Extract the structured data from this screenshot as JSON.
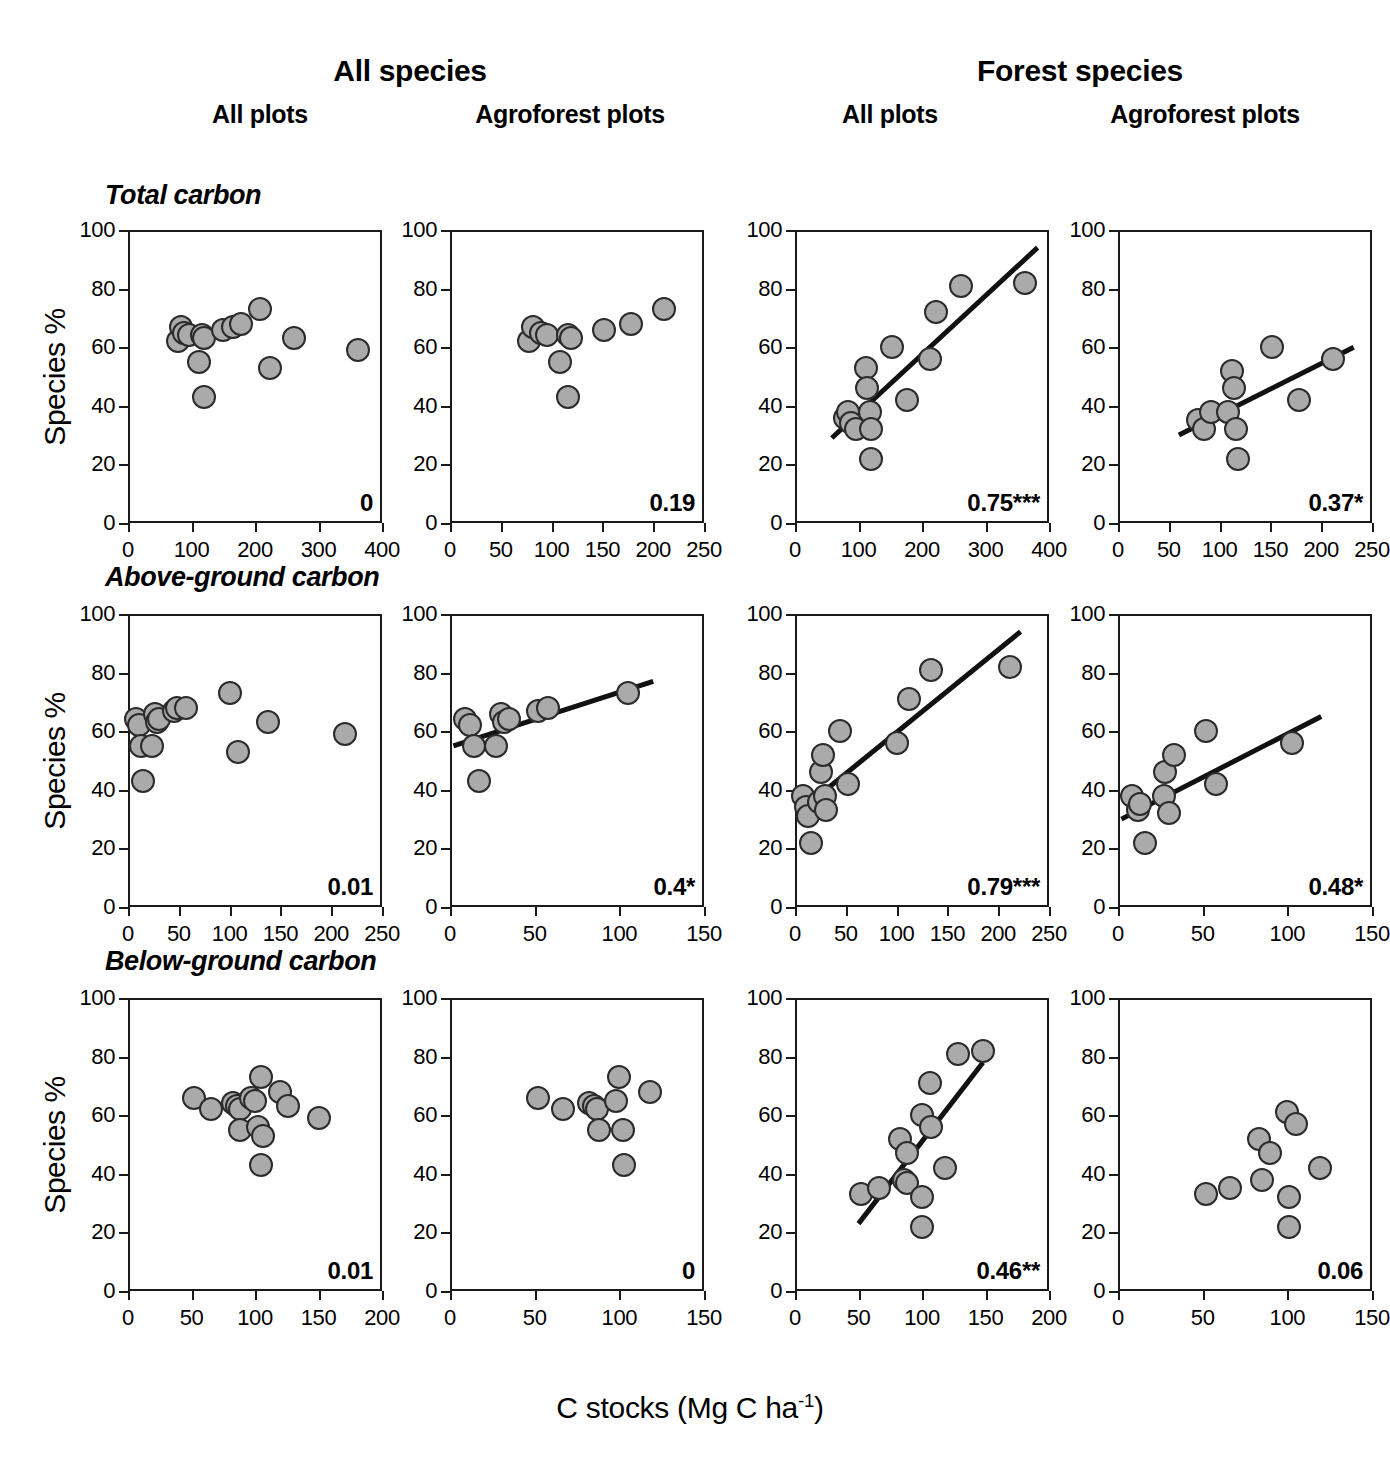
{
  "figure": {
    "group_headers": [
      {
        "label": "All species"
      },
      {
        "label": "Forest species"
      }
    ],
    "column_headers": [
      {
        "label": "All plots"
      },
      {
        "label": "Agroforest plots"
      },
      {
        "label": "All plots"
      },
      {
        "label": "Agroforest plots"
      }
    ],
    "row_headers": [
      {
        "label": "Total carbon"
      },
      {
        "label": "Above-ground carbon"
      },
      {
        "label": "Below-ground carbon"
      }
    ],
    "y_axis_label": "Species %",
    "x_axis_label_prefix": "C stocks (Mg C ha",
    "x_axis_label_sup": "-1",
    "x_axis_label_suffix": ")",
    "marker_fill": "#aaaaaa",
    "marker_stroke": "#2b2b2b",
    "line_color": "#111111",
    "axis_color": "#1a1a1a"
  },
  "chart_data": [
    {
      "id": "p1",
      "type": "scatter",
      "title": "Total carbon / All species / All plots",
      "xlabel": "C stocks (Mg C ha-1)",
      "ylabel": "Species %",
      "xlim": [
        0,
        400
      ],
      "ylim": [
        0,
        100
      ],
      "xticks": [
        0,
        100,
        200,
        300,
        400
      ],
      "yticks": [
        0,
        20,
        40,
        60,
        80,
        100
      ],
      "grid": false,
      "annotation": "0",
      "r_squared": 0,
      "significance": "",
      "fit_line": null,
      "points": [
        {
          "x": 78,
          "y": 62
        },
        {
          "x": 83,
          "y": 67
        },
        {
          "x": 88,
          "y": 65
        },
        {
          "x": 96,
          "y": 64
        },
        {
          "x": 112,
          "y": 55
        },
        {
          "x": 116,
          "y": 64
        },
        {
          "x": 120,
          "y": 63
        },
        {
          "x": 120,
          "y": 43
        },
        {
          "x": 150,
          "y": 66
        },
        {
          "x": 165,
          "y": 67
        },
        {
          "x": 178,
          "y": 68
        },
        {
          "x": 208,
          "y": 73
        },
        {
          "x": 224,
          "y": 53
        },
        {
          "x": 262,
          "y": 63
        },
        {
          "x": 362,
          "y": 59
        }
      ]
    },
    {
      "id": "p2",
      "type": "scatter",
      "title": "Total carbon / All species / Agroforest plots",
      "xlabel": "C stocks (Mg C ha-1)",
      "ylabel": "Species %",
      "xlim": [
        0,
        250
      ],
      "ylim": [
        0,
        100
      ],
      "xticks": [
        0,
        50,
        100,
        150,
        200,
        250
      ],
      "yticks": [
        0,
        20,
        40,
        60,
        80,
        100
      ],
      "grid": false,
      "annotation": "0.19",
      "r_squared": 0.19,
      "significance": "",
      "fit_line": null,
      "points": [
        {
          "x": 78,
          "y": 62
        },
        {
          "x": 82,
          "y": 67
        },
        {
          "x": 90,
          "y": 65
        },
        {
          "x": 95,
          "y": 64
        },
        {
          "x": 108,
          "y": 55
        },
        {
          "x": 116,
          "y": 64
        },
        {
          "x": 119,
          "y": 63
        },
        {
          "x": 116,
          "y": 43
        },
        {
          "x": 152,
          "y": 66
        },
        {
          "x": 178,
          "y": 68
        },
        {
          "x": 211,
          "y": 73
        }
      ]
    },
    {
      "id": "p3",
      "type": "scatter",
      "title": "Total carbon / Forest species / All plots",
      "xlabel": "C stocks (Mg C ha-1)",
      "ylabel": "Species %",
      "xlim": [
        0,
        400
      ],
      "ylim": [
        0,
        100
      ],
      "xticks": [
        0,
        100,
        200,
        300,
        400
      ],
      "yticks": [
        0,
        20,
        40,
        60,
        80,
        100
      ],
      "grid": false,
      "annotation": "0.75***",
      "r_squared": 0.75,
      "significance": "***",
      "fit_line": {
        "x1": 58,
        "y1": 29,
        "x2": 382,
        "y2": 94
      },
      "points": [
        {
          "x": 78,
          "y": 36
        },
        {
          "x": 84,
          "y": 38
        },
        {
          "x": 88,
          "y": 34
        },
        {
          "x": 96,
          "y": 32
        },
        {
          "x": 112,
          "y": 53
        },
        {
          "x": 114,
          "y": 46
        },
        {
          "x": 118,
          "y": 38
        },
        {
          "x": 120,
          "y": 32
        },
        {
          "x": 120,
          "y": 22
        },
        {
          "x": 152,
          "y": 60
        },
        {
          "x": 176,
          "y": 42
        },
        {
          "x": 212,
          "y": 56
        },
        {
          "x": 222,
          "y": 72
        },
        {
          "x": 262,
          "y": 81
        },
        {
          "x": 362,
          "y": 82
        }
      ]
    },
    {
      "id": "p4",
      "type": "scatter",
      "title": "Total carbon / Forest species / Agroforest plots",
      "xlabel": "C stocks (Mg C ha-1)",
      "ylabel": "Species %",
      "xlim": [
        0,
        250
      ],
      "ylim": [
        0,
        100
      ],
      "xticks": [
        0,
        50,
        100,
        150,
        200,
        250
      ],
      "yticks": [
        0,
        20,
        40,
        60,
        80,
        100
      ],
      "grid": false,
      "annotation": "0.37*",
      "r_squared": 0.37,
      "significance": "*",
      "fit_line": {
        "x1": 60,
        "y1": 30,
        "x2": 232,
        "y2": 60
      },
      "points": [
        {
          "x": 79,
          "y": 35
        },
        {
          "x": 85,
          "y": 32
        },
        {
          "x": 92,
          "y": 38
        },
        {
          "x": 108,
          "y": 38
        },
        {
          "x": 112,
          "y": 52
        },
        {
          "x": 114,
          "y": 46
        },
        {
          "x": 116,
          "y": 32
        },
        {
          "x": 118,
          "y": 22
        },
        {
          "x": 152,
          "y": 60
        },
        {
          "x": 178,
          "y": 42
        },
        {
          "x": 212,
          "y": 56
        }
      ]
    },
    {
      "id": "p5",
      "type": "scatter",
      "title": "Above-ground carbon / All species / All plots",
      "xlabel": "C stocks (Mg C ha-1)",
      "ylabel": "Species %",
      "xlim": [
        0,
        250
      ],
      "ylim": [
        0,
        100
      ],
      "xticks": [
        0,
        50,
        100,
        150,
        200,
        250
      ],
      "yticks": [
        0,
        20,
        40,
        60,
        80,
        100
      ],
      "grid": false,
      "annotation": "0.01",
      "r_squared": 0.01,
      "significance": "",
      "fit_line": null,
      "points": [
        {
          "x": 8,
          "y": 64
        },
        {
          "x": 11,
          "y": 62
        },
        {
          "x": 13,
          "y": 55
        },
        {
          "x": 15,
          "y": 43
        },
        {
          "x": 24,
          "y": 55
        },
        {
          "x": 27,
          "y": 66
        },
        {
          "x": 29,
          "y": 63
        },
        {
          "x": 31,
          "y": 64
        },
        {
          "x": 45,
          "y": 67
        },
        {
          "x": 48,
          "y": 68
        },
        {
          "x": 57,
          "y": 68
        },
        {
          "x": 100,
          "y": 73
        },
        {
          "x": 108,
          "y": 53
        },
        {
          "x": 138,
          "y": 63
        },
        {
          "x": 214,
          "y": 59
        }
      ]
    },
    {
      "id": "p6",
      "type": "scatter",
      "title": "Above-ground carbon / All species / Agroforest plots",
      "xlabel": "C stocks (Mg C ha-1)",
      "ylabel": "Species %",
      "xlim": [
        0,
        150
      ],
      "ylim": [
        0,
        100
      ],
      "xticks": [
        0,
        50,
        100,
        150
      ],
      "yticks": [
        0,
        20,
        40,
        60,
        80,
        100
      ],
      "grid": false,
      "annotation": "0.4*",
      "r_squared": 0.4,
      "significance": "*",
      "fit_line": {
        "x1": 2,
        "y1": 55,
        "x2": 120,
        "y2": 77
      },
      "points": [
        {
          "x": 9,
          "y": 64
        },
        {
          "x": 12,
          "y": 62
        },
        {
          "x": 14,
          "y": 55
        },
        {
          "x": 17,
          "y": 43
        },
        {
          "x": 27,
          "y": 55
        },
        {
          "x": 30,
          "y": 66
        },
        {
          "x": 32,
          "y": 63
        },
        {
          "x": 35,
          "y": 64
        },
        {
          "x": 52,
          "y": 67
        },
        {
          "x": 58,
          "y": 68
        },
        {
          "x": 105,
          "y": 73
        }
      ]
    },
    {
      "id": "p7",
      "type": "scatter",
      "title": "Above-ground carbon / Forest species / All plots",
      "xlabel": "C stocks (Mg C ha-1)",
      "ylabel": "Species %",
      "xlim": [
        0,
        250
      ],
      "ylim": [
        0,
        100
      ],
      "xticks": [
        0,
        50,
        100,
        150,
        200,
        250
      ],
      "yticks": [
        0,
        20,
        40,
        60,
        80,
        100
      ],
      "grid": false,
      "annotation": "0.79***",
      "r_squared": 0.79,
      "significance": "***",
      "fit_line": {
        "x1": 2,
        "y1": 32,
        "x2": 222,
        "y2": 94
      },
      "points": [
        {
          "x": 8,
          "y": 38
        },
        {
          "x": 11,
          "y": 34
        },
        {
          "x": 13,
          "y": 31
        },
        {
          "x": 16,
          "y": 22
        },
        {
          "x": 24,
          "y": 36
        },
        {
          "x": 26,
          "y": 46
        },
        {
          "x": 28,
          "y": 52
        },
        {
          "x": 30,
          "y": 38
        },
        {
          "x": 31,
          "y": 33
        },
        {
          "x": 44,
          "y": 60
        },
        {
          "x": 52,
          "y": 42
        },
        {
          "x": 100,
          "y": 56
        },
        {
          "x": 112,
          "y": 71
        },
        {
          "x": 134,
          "y": 81
        },
        {
          "x": 212,
          "y": 82
        }
      ]
    },
    {
      "id": "p8",
      "type": "scatter",
      "title": "Above-ground carbon / Forest species / Agroforest plots",
      "xlabel": "C stocks (Mg C ha-1)",
      "ylabel": "Species %",
      "xlim": [
        0,
        150
      ],
      "ylim": [
        0,
        100
      ],
      "xticks": [
        0,
        50,
        100,
        150
      ],
      "yticks": [
        0,
        20,
        40,
        60,
        80,
        100
      ],
      "grid": false,
      "annotation": "0.48*",
      "r_squared": 0.48,
      "significance": "*",
      "fit_line": {
        "x1": 2,
        "y1": 30,
        "x2": 120,
        "y2": 65
      },
      "points": [
        {
          "x": 8,
          "y": 38
        },
        {
          "x": 12,
          "y": 33
        },
        {
          "x": 13,
          "y": 35
        },
        {
          "x": 16,
          "y": 22
        },
        {
          "x": 27,
          "y": 38
        },
        {
          "x": 28,
          "y": 46
        },
        {
          "x": 30,
          "y": 32
        },
        {
          "x": 33,
          "y": 52
        },
        {
          "x": 52,
          "y": 60
        },
        {
          "x": 58,
          "y": 42
        },
        {
          "x": 103,
          "y": 56
        }
      ]
    },
    {
      "id": "p9",
      "type": "scatter",
      "title": "Below-ground carbon / All species / All plots",
      "xlabel": "C stocks (Mg C ha-1)",
      "ylabel": "Species %",
      "xlim": [
        0,
        200
      ],
      "ylim": [
        0,
        100
      ],
      "xticks": [
        0,
        50,
        100,
        150,
        200
      ],
      "yticks": [
        0,
        20,
        40,
        60,
        80,
        100
      ],
      "grid": false,
      "annotation": "0.01",
      "r_squared": 0.01,
      "significance": "",
      "fit_line": null,
      "points": [
        {
          "x": 52,
          "y": 66
        },
        {
          "x": 65,
          "y": 62
        },
        {
          "x": 83,
          "y": 64
        },
        {
          "x": 86,
          "y": 63
        },
        {
          "x": 88,
          "y": 62
        },
        {
          "x": 88,
          "y": 55
        },
        {
          "x": 97,
          "y": 66
        },
        {
          "x": 100,
          "y": 65
        },
        {
          "x": 102,
          "y": 56
        },
        {
          "x": 105,
          "y": 73
        },
        {
          "x": 106,
          "y": 53
        },
        {
          "x": 105,
          "y": 43
        },
        {
          "x": 120,
          "y": 68
        },
        {
          "x": 126,
          "y": 63
        },
        {
          "x": 150,
          "y": 59
        }
      ]
    },
    {
      "id": "p10",
      "type": "scatter",
      "title": "Below-ground carbon / All species / Agroforest plots",
      "xlabel": "C stocks (Mg C ha-1)",
      "ylabel": "Species %",
      "xlim": [
        0,
        150
      ],
      "ylim": [
        0,
        100
      ],
      "xticks": [
        0,
        50,
        100,
        150
      ],
      "yticks": [
        0,
        20,
        40,
        60,
        80,
        100
      ],
      "grid": false,
      "annotation": "0",
      "r_squared": 0,
      "significance": "",
      "fit_line": null,
      "points": [
        {
          "x": 52,
          "y": 66
        },
        {
          "x": 67,
          "y": 62
        },
        {
          "x": 82,
          "y": 64
        },
        {
          "x": 85,
          "y": 63
        },
        {
          "x": 87,
          "y": 62
        },
        {
          "x": 88,
          "y": 55
        },
        {
          "x": 98,
          "y": 65
        },
        {
          "x": 100,
          "y": 73
        },
        {
          "x": 102,
          "y": 55
        },
        {
          "x": 103,
          "y": 43
        },
        {
          "x": 118,
          "y": 68
        }
      ]
    },
    {
      "id": "p11",
      "type": "scatter",
      "title": "Below-ground carbon / Forest species / All plots",
      "xlabel": "C stocks (Mg C ha-1)",
      "ylabel": "Species %",
      "xlim": [
        0,
        200
      ],
      "ylim": [
        0,
        100
      ],
      "xticks": [
        0,
        50,
        100,
        150,
        200
      ],
      "yticks": [
        0,
        20,
        40,
        60,
        80,
        100
      ],
      "grid": false,
      "annotation": "0.46**",
      "r_squared": 0.46,
      "significance": "**",
      "fit_line": {
        "x1": 50,
        "y1": 23,
        "x2": 148,
        "y2": 78
      },
      "points": [
        {
          "x": 52,
          "y": 33
        },
        {
          "x": 66,
          "y": 35
        },
        {
          "x": 83,
          "y": 52
        },
        {
          "x": 86,
          "y": 38
        },
        {
          "x": 88,
          "y": 47
        },
        {
          "x": 88,
          "y": 37
        },
        {
          "x": 100,
          "y": 60
        },
        {
          "x": 100,
          "y": 32
        },
        {
          "x": 100,
          "y": 22
        },
        {
          "x": 106,
          "y": 71
        },
        {
          "x": 107,
          "y": 56
        },
        {
          "x": 118,
          "y": 42
        },
        {
          "x": 128,
          "y": 81
        },
        {
          "x": 148,
          "y": 82
        }
      ]
    },
    {
      "id": "p12",
      "type": "scatter",
      "title": "Below-ground carbon / Forest species / Agroforest plots",
      "xlabel": "C stocks (Mg C ha-1)",
      "ylabel": "Species %",
      "xlim": [
        0,
        150
      ],
      "ylim": [
        0,
        100
      ],
      "xticks": [
        0,
        50,
        100,
        150
      ],
      "yticks": [
        0,
        20,
        40,
        60,
        80,
        100
      ],
      "grid": false,
      "annotation": "0.06",
      "r_squared": 0.06,
      "significance": "",
      "fit_line": null,
      "points": [
        {
          "x": 52,
          "y": 33
        },
        {
          "x": 66,
          "y": 35
        },
        {
          "x": 83,
          "y": 52
        },
        {
          "x": 85,
          "y": 38
        },
        {
          "x": 90,
          "y": 47
        },
        {
          "x": 100,
          "y": 61
        },
        {
          "x": 101,
          "y": 32
        },
        {
          "x": 101,
          "y": 22
        },
        {
          "x": 105,
          "y": 57
        },
        {
          "x": 119,
          "y": 42
        }
      ]
    }
  ]
}
